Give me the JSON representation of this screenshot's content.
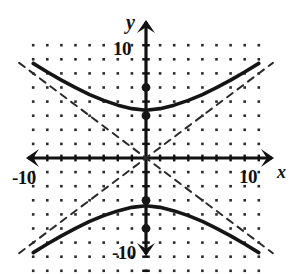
{
  "figure": {
    "title": "",
    "axis_labels": {
      "x": "x",
      "y": "y"
    },
    "tick_labels": {
      "y_top": "10",
      "y_bottom": "-10",
      "x_left": "-10",
      "x_right": "10"
    },
    "colors": {
      "curve": "#151515",
      "asymptote": "#2a2a2a",
      "axis": "#111111",
      "grid_dot": "#2b2b2b",
      "background": "#ffffff"
    }
  },
  "chart_data": {
    "type": "line",
    "xlabel": "x",
    "ylabel": "y",
    "xlim": [
      -11.5,
      11.5
    ],
    "ylim": [
      -11.5,
      11.5
    ],
    "grid": "dotted",
    "grid_spacing": 1,
    "grid_x_range": [
      -8,
      8
    ],
    "grid_y_range": [
      -8,
      8
    ],
    "xticks": [
      -10,
      10
    ],
    "yticks": [
      -10,
      10
    ],
    "legend": "none",
    "equation": "y^2/9 - x^2/16 = 1",
    "center": [
      0,
      0
    ],
    "a": 3,
    "b": 4,
    "c": 5,
    "asymptote_slope": 0.75,
    "series": [
      {
        "name": "upper branch",
        "style": "solid",
        "x": [
          -8,
          -7,
          -6,
          -5,
          -4,
          -3,
          -2,
          -1,
          0,
          1,
          2,
          3,
          4,
          5,
          6,
          7,
          8
        ],
        "y": [
          6.71,
          6.1,
          5.52,
          4.99,
          4.5,
          4.09,
          3.75,
          3.5,
          3.39,
          3.5,
          3.75,
          4.09,
          4.5,
          4.99,
          5.52,
          6.1,
          6.71
        ]
      },
      {
        "name": "lower branch",
        "style": "solid",
        "x": [
          -8,
          -7,
          -6,
          -5,
          -4,
          -3,
          -2,
          -1,
          0,
          1,
          2,
          3,
          4,
          5,
          6,
          7,
          8
        ],
        "y": [
          -6.71,
          -6.1,
          -5.52,
          -4.99,
          -4.5,
          -4.09,
          -3.75,
          -3.5,
          -3.39,
          -3.5,
          -3.75,
          -4.09,
          -4.5,
          -4.99,
          -5.52,
          -6.1,
          -6.71
        ]
      },
      {
        "name": "asymptote positive slope",
        "style": "dashed",
        "x": [
          -9,
          9
        ],
        "y": [
          -6.75,
          6.75
        ]
      },
      {
        "name": "asymptote negative slope",
        "style": "dashed",
        "x": [
          -9,
          9
        ],
        "y": [
          6.75,
          -6.75
        ]
      }
    ],
    "points": [
      {
        "name": "focus-upper",
        "x": 0,
        "y": 5,
        "marker": "filled-circle"
      },
      {
        "name": "vertex-upper",
        "x": 0,
        "y": 3,
        "marker": "filled-circle"
      },
      {
        "name": "vertex-lower",
        "x": 0,
        "y": -3,
        "marker": "filled-circle"
      },
      {
        "name": "focus-lower",
        "x": 0,
        "y": -5,
        "marker": "filled-circle"
      }
    ]
  }
}
